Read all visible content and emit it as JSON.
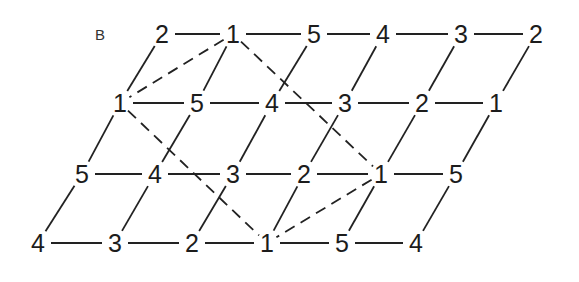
{
  "panel_label": "B",
  "colors": {
    "line": "#222222",
    "text": "#1c1c1c",
    "background": "#ffffff"
  },
  "lattice": {
    "rows": [
      {
        "y": 34,
        "nodes": [
          {
            "x": 162,
            "label": "2"
          },
          {
            "x": 233,
            "label": "1"
          },
          {
            "x": 314,
            "label": "5"
          },
          {
            "x": 383,
            "label": "4"
          },
          {
            "x": 461,
            "label": "3"
          },
          {
            "x": 536,
            "label": "2"
          }
        ]
      },
      {
        "y": 103,
        "nodes": [
          {
            "x": 120,
            "label": "1"
          },
          {
            "x": 197,
            "label": "5"
          },
          {
            "x": 272,
            "label": "4"
          },
          {
            "x": 345,
            "label": "3"
          },
          {
            "x": 422,
            "label": "2"
          },
          {
            "x": 496,
            "label": "1"
          }
        ]
      },
      {
        "y": 174,
        "nodes": [
          {
            "x": 82,
            "label": "5"
          },
          {
            "x": 155,
            "label": "4"
          },
          {
            "x": 233,
            "label": "3"
          },
          {
            "x": 304,
            "label": "2"
          },
          {
            "x": 381,
            "label": "1"
          },
          {
            "x": 456,
            "label": "5"
          }
        ]
      },
      {
        "y": 243,
        "nodes": [
          {
            "x": 38,
            "label": "4"
          },
          {
            "x": 115,
            "label": "3"
          },
          {
            "x": 192,
            "label": "2"
          },
          {
            "x": 267,
            "label": "1"
          },
          {
            "x": 342,
            "label": "5"
          },
          {
            "x": 416,
            "label": "4"
          }
        ]
      }
    ],
    "edges": {
      "horizontal": "adjacent nodes in each row (solid)",
      "diagonal": "node (row r, col c) to node (row r-1, col c) (solid)"
    },
    "dashed_rhombus": [
      {
        "from": [
          0,
          1
        ],
        "to": [
          1,
          0
        ]
      },
      {
        "from": [
          0,
          1
        ],
        "to": [
          2,
          4
        ]
      },
      {
        "from": [
          1,
          0
        ],
        "to": [
          3,
          3
        ]
      },
      {
        "from": [
          2,
          4
        ],
        "to": [
          3,
          3
        ]
      }
    ]
  }
}
